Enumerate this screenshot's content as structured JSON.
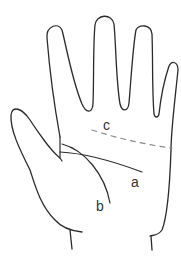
{
  "diagram": {
    "labels": {
      "a": "a",
      "b": "b",
      "c": "c"
    },
    "colors": {
      "outline": "#2a2a2a",
      "dashed_line": "#8a8a8a",
      "label_text": "#333333",
      "background": "#ffffff"
    }
  }
}
